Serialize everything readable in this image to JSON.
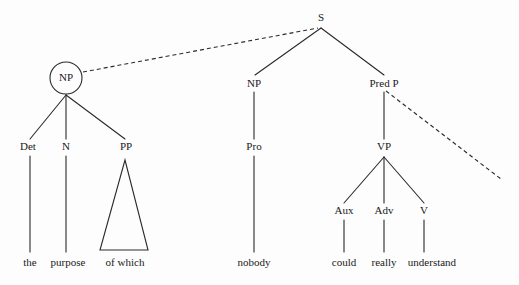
{
  "diagram": {
    "type": "syntax-tree",
    "title": "",
    "background_color": "#fdfdfd",
    "line_color": "#2a2a2a",
    "text_color": "#1a1a1a",
    "nodes": {
      "s": "S",
      "np_circled": "NP",
      "det": "Det",
      "n": "N",
      "pp": "PP",
      "np_subject": "NP",
      "pro": "Pro",
      "pred_p": "Pred P",
      "vp": "VP",
      "aux": "Aux",
      "adv": "Adv",
      "v": "V"
    },
    "leaves": {
      "the": "the",
      "purpose": "purpose",
      "of_which": "of which",
      "nobody": "nobody",
      "could": "could",
      "really": "really",
      "understand": "understand"
    },
    "sentence": "the purpose of which nobody could really understand",
    "annotations": {
      "movement_line_1": "dashed movement line from circled NP to S",
      "movement_line_2": "dashed movement line from Pred P to lower right"
    }
  }
}
